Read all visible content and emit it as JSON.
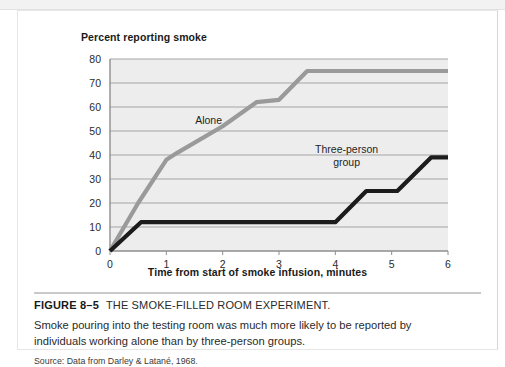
{
  "figure": {
    "number": "FIGURE 8–5",
    "title": "THE SMOKE-FILLED ROOM EXPERIMENT.",
    "body": "Smoke pouring into the testing room was much more likely to be reported by individuals working alone than by three-person groups.",
    "source": "Source: Data from Darley & Latané, 1968."
  },
  "chart_data": {
    "type": "line",
    "title": "",
    "ylabel": "Percent reporting smoke",
    "xlabel": "Time from start of smoke infusion, minutes",
    "xlim": [
      0,
      6
    ],
    "ylim": [
      0,
      80
    ],
    "xticks": [
      "0",
      "1",
      "2",
      "3",
      "4",
      "5",
      "6"
    ],
    "yticks": [
      "0",
      "10",
      "20",
      "30",
      "40",
      "50",
      "60",
      "70",
      "80"
    ],
    "grid": "horizontal",
    "legend": "inline-labels",
    "plot_background": "#ededed",
    "series": [
      {
        "name": "Alone",
        "color": "#9a9a9a",
        "label_x": 1.75,
        "label_y": 53,
        "points": [
          {
            "x": 0.0,
            "y": 0
          },
          {
            "x": 0.5,
            "y": 20
          },
          {
            "x": 1.0,
            "y": 38
          },
          {
            "x": 1.2,
            "y": 41
          },
          {
            "x": 2.0,
            "y": 52
          },
          {
            "x": 2.6,
            "y": 62
          },
          {
            "x": 3.0,
            "y": 63
          },
          {
            "x": 3.5,
            "y": 75
          },
          {
            "x": 6.0,
            "y": 75
          }
        ]
      },
      {
        "name": "Three-person group",
        "color": "#1c1c1c",
        "label_x": 4.2,
        "label_y": 41,
        "points": [
          {
            "x": 0.0,
            "y": 0
          },
          {
            "x": 0.55,
            "y": 12
          },
          {
            "x": 4.0,
            "y": 12
          },
          {
            "x": 4.55,
            "y": 25
          },
          {
            "x": 5.1,
            "y": 25
          },
          {
            "x": 5.7,
            "y": 39
          },
          {
            "x": 6.0,
            "y": 39
          }
        ]
      }
    ]
  }
}
